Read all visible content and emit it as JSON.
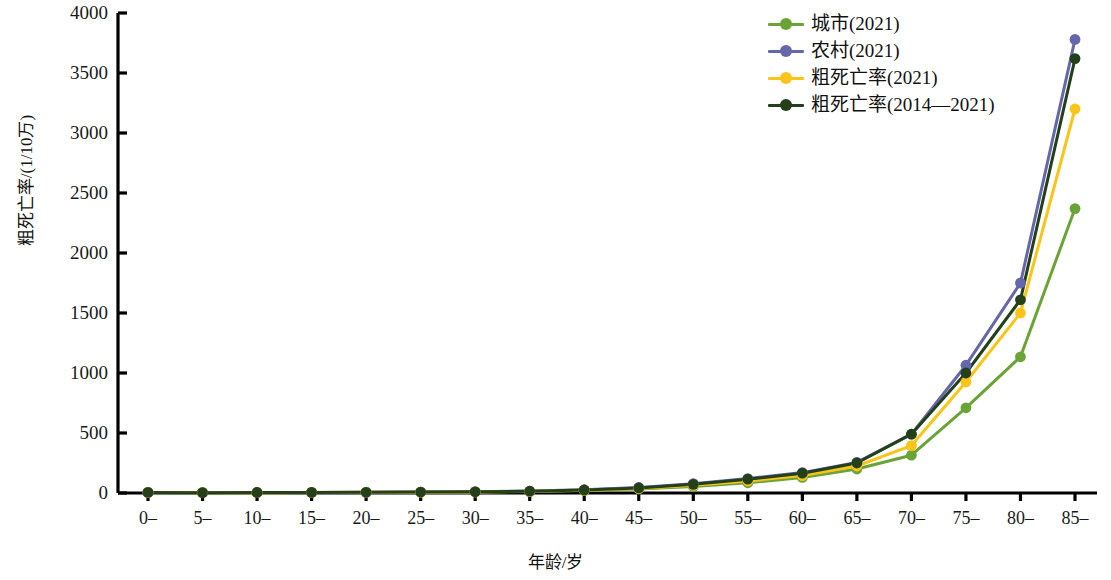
{
  "chart_data": {
    "type": "line",
    "title": "",
    "xlabel": "年龄/岁",
    "ylabel": "粗死亡率/(1/10万)",
    "categories": [
      "0–",
      "5–",
      "10–",
      "15–",
      "20–",
      "25–",
      "30–",
      "35–",
      "40–",
      "45–",
      "50–",
      "55–",
      "60–",
      "65–",
      "70–",
      "75–",
      "80–",
      "85–"
    ],
    "ylim": [
      0,
      4000
    ],
    "y_ticks": [
      0,
      500,
      1000,
      1500,
      2000,
      2500,
      3000,
      3500,
      4000
    ],
    "grid": false,
    "legend_position": "top-right",
    "series": [
      {
        "name": "城市(2021)",
        "color": "#6aa436",
        "values": [
          4,
          3,
          3,
          4,
          5,
          6,
          8,
          12,
          20,
          33,
          55,
          85,
          130,
          200,
          315,
          710,
          1135,
          2370
        ]
      },
      {
        "name": "农村(2021)",
        "color": "#6667ab",
        "values": [
          5,
          3,
          4,
          5,
          7,
          8,
          11,
          16,
          27,
          46,
          78,
          120,
          170,
          255,
          490,
          1065,
          1750,
          3780
        ]
      },
      {
        "name": "粗死亡率(2021)",
        "color": "#fbc419",
        "values": [
          4,
          3,
          3,
          4,
          6,
          7,
          9,
          14,
          23,
          38,
          64,
          100,
          145,
          225,
          395,
          925,
          1500,
          3200
        ]
      },
      {
        "name": "粗死亡率(2014—2021)",
        "color": "#24401b",
        "values": [
          5,
          3,
          4,
          5,
          6,
          8,
          10,
          15,
          25,
          42,
          72,
          115,
          165,
          250,
          490,
          1000,
          1610,
          3620
        ]
      }
    ]
  },
  "y_axis": {
    "title": "粗死亡率/(1/10万)",
    "tick_labels": [
      "0",
      "500",
      "1000",
      "1500",
      "2000",
      "2500",
      "3000",
      "3500",
      "4000"
    ]
  },
  "x_axis": {
    "title": "年龄/岁",
    "tick_labels": [
      "0–",
      "5–",
      "10–",
      "15–",
      "20–",
      "25–",
      "30–",
      "35–",
      "40–",
      "45–",
      "50–",
      "55–",
      "60–",
      "65–",
      "70–",
      "75–",
      "80–",
      "85–"
    ]
  },
  "legend": {
    "items": [
      {
        "label": "城市(2021)",
        "color": "#6aa436"
      },
      {
        "label": "农村(2021)",
        "color": "#6667ab"
      },
      {
        "label": "粗死亡率(2021)",
        "color": "#fbc419"
      },
      {
        "label": "粗死亡率(2014—2021)",
        "color": "#24401b"
      }
    ]
  }
}
